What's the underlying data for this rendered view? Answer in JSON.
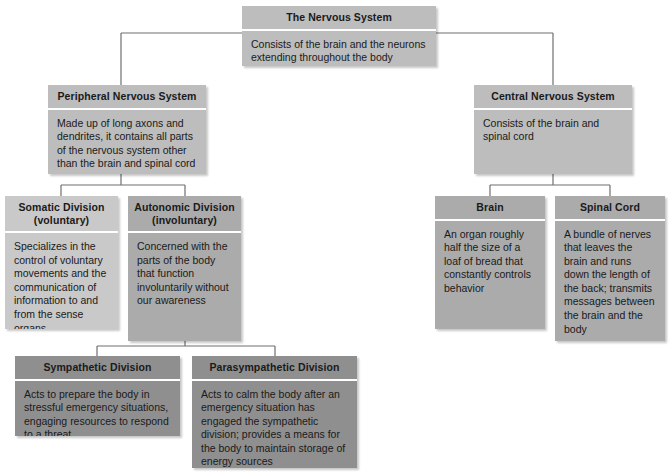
{
  "diagram": {
    "title": "The Nervous System",
    "line_color": "#6f6f6f",
    "nodes": {
      "root": {
        "header": "The Nervous System",
        "body": "Consists of the brain and the neurons extending throughout the body",
        "color": "#bdbdbd"
      },
      "peripheral": {
        "header": "Peripheral Nervous System",
        "body": "Made up of long axons and dendrites, it contains all parts of the nervous system other than the brain and spinal cord",
        "color": "#bdbdbd"
      },
      "central": {
        "header": "Central Nervous System",
        "body": "Consists of the brain and spinal cord",
        "color": "#bdbdbd"
      },
      "somatic": {
        "header": "Somatic Division (voluntary)",
        "header_line1": "Somatic Division",
        "header_line2": "(voluntary)",
        "body": "Specializes in the control of voluntary movements and the communication of information to and from the sense organs",
        "color": "#c9c9c9"
      },
      "autonomic": {
        "header": "Autonomic Division (involuntary)",
        "header_line1": "Autonomic Division",
        "header_line2": "(involuntary)",
        "body": "Concerned with the parts of the body that function involuntarily without our awareness",
        "color": "#ababab"
      },
      "brain": {
        "header": "Brain",
        "body": "An organ roughly half the size of a loaf of bread that constantly controls behavior",
        "color": "#ababab"
      },
      "spinal_cord": {
        "header": "Spinal Cord",
        "body": "A bundle of nerves that leaves the brain and runs down the length of the back; transmits messages between the brain and the body",
        "color": "#ababab"
      },
      "sympathetic": {
        "header": "Sympathetic Division",
        "body": "Acts to prepare the body in stressful emergency situations, engaging resources to respond to a threat",
        "color": "#8f8f8f"
      },
      "parasympathetic": {
        "header": "Parasympathetic Division",
        "body": "Acts to calm the body after an emergency situation has engaged the sympathetic division; provides a means for the body to maintain storage of energy sources",
        "color": "#8f8f8f"
      }
    },
    "edges": [
      {
        "from": "root",
        "to": "peripheral"
      },
      {
        "from": "root",
        "to": "central"
      },
      {
        "from": "peripheral",
        "to": "somatic"
      },
      {
        "from": "peripheral",
        "to": "autonomic"
      },
      {
        "from": "central",
        "to": "brain"
      },
      {
        "from": "central",
        "to": "spinal_cord"
      },
      {
        "from": "autonomic",
        "to": "sympathetic"
      },
      {
        "from": "autonomic",
        "to": "parasympathetic"
      }
    ]
  }
}
